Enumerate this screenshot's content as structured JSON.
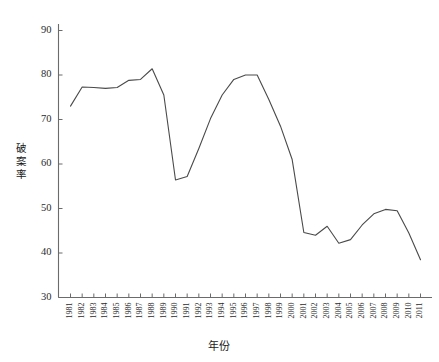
{
  "chart_data": {
    "type": "line",
    "title": "",
    "xlabel": "年份",
    "ylabel": "破案率",
    "ylim": [
      30,
      90
    ],
    "yticks": [
      30,
      40,
      50,
      60,
      70,
      80,
      90
    ],
    "grid": false,
    "legend": "none",
    "categories": [
      "1981",
      "1982",
      "1983",
      "1984",
      "1985",
      "1986",
      "1987",
      "1988",
      "1989",
      "1990",
      "1991",
      "1992",
      "1993",
      "1994",
      "1995",
      "1996",
      "1997",
      "1998",
      "1999",
      "2000",
      "2001",
      "2002",
      "2003",
      "2004",
      "2005",
      "2006",
      "2007",
      "2008",
      "2009",
      "2010",
      "2011"
    ],
    "series": [
      {
        "name": "破案率",
        "values": [
          73.0,
          77.3,
          77.2,
          77.0,
          77.2,
          78.8,
          79.0,
          81.4,
          75.5,
          56.4,
          57.2,
          63.5,
          70.2,
          75.5,
          79.0,
          80.0,
          80.0,
          74.5,
          68.5,
          61.0,
          44.6,
          44.0,
          46.0,
          42.2,
          43.0,
          46.3,
          48.8,
          49.8,
          49.5,
          44.5,
          38.5
        ]
      }
    ]
  },
  "axes": {
    "y_tick_labels": [
      "90",
      "80",
      "70",
      "60",
      "50",
      "40",
      "30"
    ],
    "y_axis_title": "破案率",
    "y_axis_title_chars": [
      "破",
      "案",
      "率"
    ],
    "x_axis_title": "年份",
    "x_tick_labels": [
      "1981",
      "1982",
      "1983",
      "1984",
      "1985",
      "1986",
      "1987",
      "1988",
      "1989",
      "1990",
      "1991",
      "1992",
      "1993",
      "1994",
      "1995",
      "1996",
      "1997",
      "1998",
      "1999",
      "2000",
      "2001",
      "2002",
      "2003",
      "2004",
      "2005",
      "2006",
      "2007",
      "2008",
      "2009",
      "2010",
      "2011"
    ]
  },
  "style": {
    "line_color": "#4a4a4a",
    "axis_color": "#6b6b6b",
    "background": "#ffffff",
    "text_color": "#1a1a1a"
  }
}
